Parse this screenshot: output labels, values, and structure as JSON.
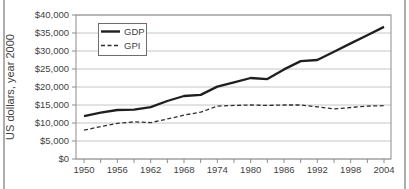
{
  "panel": {
    "background": "#ffffff",
    "edge_rule_color": "#aeaeae"
  },
  "chart_data": {
    "type": "line",
    "title": "",
    "xlabel": "",
    "ylabel": "US dollars, year 2000",
    "ylim": [
      0,
      40000
    ],
    "y_tick_step": 5000,
    "y_ticks": [
      0,
      5000,
      10000,
      15000,
      20000,
      25000,
      30000,
      35000,
      40000
    ],
    "y_tick_labels": [
      "$0",
      "$5,000",
      "$10,000",
      "$15,000",
      "$20,000",
      "$25,000",
      "$30,000",
      "$35,000",
      "$40,000"
    ],
    "x": [
      1950,
      1953,
      1956,
      1959,
      1962,
      1965,
      1968,
      1971,
      1974,
      1977,
      1980,
      1983,
      1986,
      1989,
      1992,
      1995,
      1998,
      2001,
      2004
    ],
    "x_tick_labels": [
      "1950",
      "1956",
      "1962",
      "1968",
      "1974",
      "1980",
      "1986",
      "1992",
      "1998",
      "2004"
    ],
    "grid": "horizontal",
    "legend_position": "top-left-inside",
    "series": [
      {
        "name": "GDP",
        "style": "solid",
        "color": "#1f1f1f",
        "values": [
          11900,
          12900,
          13600,
          13700,
          14400,
          16100,
          17500,
          17800,
          20100,
          21300,
          22500,
          22200,
          24900,
          27200,
          27500,
          29800,
          32100,
          34400,
          36700
        ]
      },
      {
        "name": "GPI",
        "style": "dashed",
        "color": "#2e2e2e",
        "values": [
          8000,
          9000,
          9900,
          10300,
          10100,
          11100,
          12200,
          13000,
          14700,
          14900,
          15000,
          14900,
          15000,
          15000,
          14500,
          13900,
          14300,
          14700,
          14800
        ]
      }
    ],
    "style": {
      "grid_color": "#c6c6c6",
      "frame_color": "#8c8c8c",
      "tick_color": "#8c8c8c",
      "label_color": "#3f3f3f"
    }
  }
}
